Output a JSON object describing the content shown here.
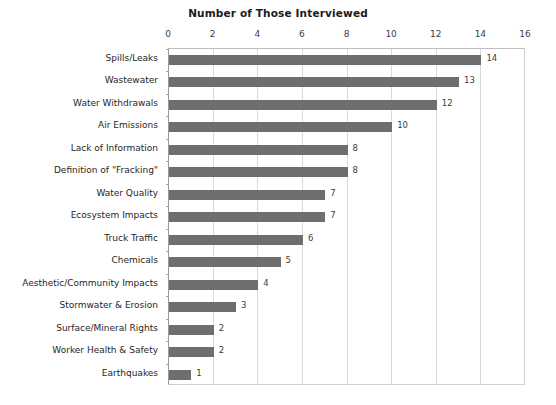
{
  "chart_data": {
    "type": "bar",
    "orientation": "horizontal",
    "title": "Number of Those Interviewed",
    "xlabel": "",
    "ylabel": "",
    "xlim": [
      0,
      16
    ],
    "xticks": [
      0,
      2,
      4,
      6,
      8,
      10,
      12,
      14,
      16
    ],
    "grid": true,
    "legend": false,
    "bar_color": "#6e6e6e",
    "gridline_color": "#d9d9d9",
    "categories": [
      "Spills/Leaks",
      "Wastewater",
      "Water Withdrawals",
      "Air Emissions",
      "Lack of Information",
      "Definition of \"Fracking\"",
      "Water Quality",
      "Ecosystem Impacts",
      "Truck Traffic",
      "Chemicals",
      "Aesthetic/Community Impacts",
      "Stormwater & Erosion",
      "Surface/Mineral Rights",
      "Worker Health & Safety",
      "Earthquakes"
    ],
    "values": [
      14,
      13,
      12,
      10,
      8,
      8,
      7,
      7,
      6,
      5,
      4,
      3,
      2,
      2,
      1
    ],
    "data_labels": [
      "14",
      "13",
      "12",
      "10",
      "8",
      "8",
      "7",
      "7",
      "6",
      "5",
      "4",
      "3",
      "2",
      "2",
      "1"
    ],
    "tick_labels": [
      "0",
      "2",
      "4",
      "6",
      "8",
      "10",
      "12",
      "14",
      "16"
    ]
  }
}
